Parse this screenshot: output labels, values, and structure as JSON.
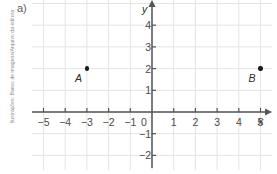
{
  "credit": {
    "text": "Ilustrações: Banco de imagens/Arquivo da editora"
  },
  "item": {
    "label": "a)"
  },
  "axes": {
    "x_name": "x",
    "y_name": "y",
    "origin_label": "0"
  },
  "chart_data": {
    "type": "scatter",
    "title": "",
    "xlabel": "x",
    "ylabel": "y",
    "grid": true,
    "legend": "none",
    "xlim": [
      -5.5,
      5.5
    ],
    "ylim": [
      -2.8,
      5.0
    ],
    "xticks": [
      -5,
      -4,
      -3,
      -2,
      -1,
      1,
      2,
      3,
      4,
      5
    ],
    "yticks": [
      4,
      3,
      2,
      1,
      -1,
      -2
    ],
    "xtick_labels": [
      "−5",
      "−4",
      "−3",
      "−2",
      "−1",
      "1",
      "2",
      "3",
      "4",
      "5"
    ],
    "ytick_labels": [
      "4",
      "3",
      "2",
      "1",
      "−1",
      "−2"
    ],
    "points": [
      {
        "label": "A",
        "x": -3,
        "y": 2
      },
      {
        "label": "B",
        "x": 5,
        "y": 2
      }
    ]
  },
  "colors": {
    "grid": "#e4e4e6",
    "axis": "#555555",
    "point": "#1a1a1a",
    "text": "#4a4a4a",
    "credit": "#8d8d8d"
  }
}
